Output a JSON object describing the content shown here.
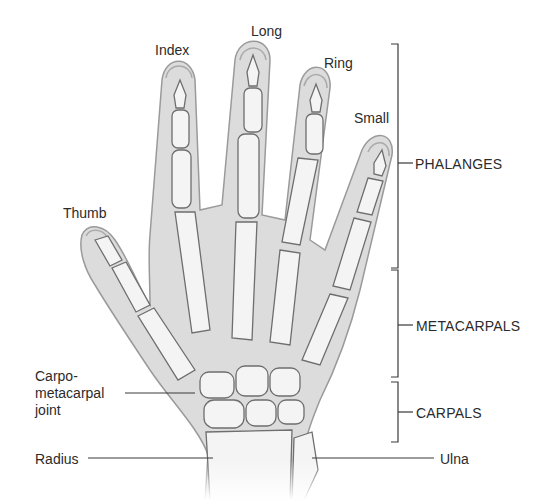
{
  "diagram": {
    "finger_labels": {
      "thumb": "Thumb",
      "index": "Index",
      "long": "Long",
      "ring": "Ring",
      "small": "Small"
    },
    "group_labels": {
      "phalanges": "PHALANGES",
      "metacarpals": "METACARPALS",
      "carpals": "CARPALS"
    },
    "structure_labels": {
      "carpometacarpal_joint": "Carpo-metacarpal joint",
      "carpometacarpal_line1": "Carpo-",
      "carpometacarpal_line2": "metacarpal",
      "carpometacarpal_line3": "joint",
      "radius": "Radius",
      "ulna": "Ulna"
    },
    "colors": {
      "background": "#ffffff",
      "skin_fill": "#dcdcdc",
      "skin_outline": "#9a9a9a",
      "bone_fill": "#f4f4f4",
      "bone_outline": "#6e6e6e",
      "leader_line": "#3a3a3a",
      "text": "#2b2b2b"
    }
  }
}
